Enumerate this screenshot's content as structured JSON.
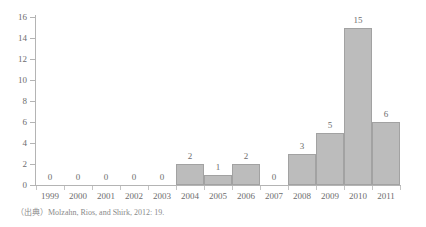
{
  "chart_data": {
    "type": "bar",
    "title": "",
    "xlabel": "",
    "ylabel": "",
    "categories": [
      "1999",
      "2000",
      "2001",
      "2002",
      "2003",
      "2004",
      "2005",
      "2006",
      "2007",
      "2008",
      "2009",
      "2010",
      "2011"
    ],
    "values": [
      0,
      0,
      0,
      0,
      0,
      2,
      1,
      2,
      0,
      3,
      5,
      15,
      6
    ],
    "value_labels": [
      "0",
      "0",
      "0",
      "0",
      "0",
      "2",
      "1",
      "2",
      "0",
      "3",
      "5",
      "15",
      "6"
    ],
    "ylim": [
      0,
      16
    ],
    "ytick_values": [
      0,
      2,
      4,
      6,
      8,
      10,
      12,
      14,
      16
    ],
    "ytick_labels": [
      "0",
      "2",
      "4",
      "6",
      "8",
      "10",
      "12",
      "14",
      "16"
    ],
    "grid": false,
    "legend": null,
    "legend_position": "none",
    "series_name": "",
    "bar_fill_color": "#bcbcbc",
    "bar_border_color": "#a2a2a2",
    "axis_color": "#b4b4b4",
    "text_color": "#6d6d6d",
    "background_color": "#ffffff",
    "data_labels_shown": true
  },
  "figure": {
    "title_clipped": "",
    "source_note": "（出典）Molzahn, Rios, and Shirk, 2012: 19."
  }
}
